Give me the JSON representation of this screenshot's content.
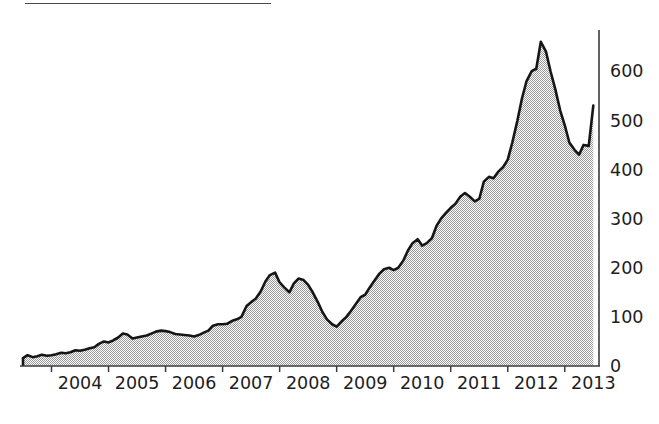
{
  "figure": {
    "top_rule": true,
    "background_color": "#ffffff"
  },
  "chart_data": {
    "type": "area",
    "title": "",
    "subtitle": "",
    "xlabel": "",
    "ylabel": "",
    "grid": false,
    "legend": "none",
    "fill_color": "#b3b3b3",
    "line_color": "#161616",
    "axis_color": "#3c3c3c",
    "xlim": [
      2003.5,
      2013.6
    ],
    "ylim": [
      0,
      690
    ],
    "y_ticks": [
      0,
      100,
      200,
      300,
      400,
      500,
      600
    ],
    "y_tick_labels": [
      "0",
      "100",
      "200",
      "300",
      "400",
      "500",
      "600"
    ],
    "x_ticks": [
      2004,
      2005,
      2006,
      2007,
      2008,
      2009,
      2010,
      2011,
      2012,
      2013
    ],
    "x_tick_labels": [
      "2004",
      "2005",
      "2006",
      "2007",
      "2008",
      "2009",
      "2010",
      "2011",
      "2012",
      "2013"
    ],
    "x": [
      2003.5,
      2003.58,
      2003.67,
      2003.75,
      2003.83,
      2003.92,
      2004.0,
      2004.08,
      2004.17,
      2004.25,
      2004.33,
      2004.42,
      2004.5,
      2004.58,
      2004.67,
      2004.75,
      2004.83,
      2004.92,
      2005.0,
      2005.08,
      2005.17,
      2005.25,
      2005.33,
      2005.42,
      2005.5,
      2005.58,
      2005.67,
      2005.75,
      2005.83,
      2005.92,
      2006.0,
      2006.08,
      2006.17,
      2006.25,
      2006.33,
      2006.42,
      2006.5,
      2006.58,
      2006.67,
      2006.75,
      2006.83,
      2006.92,
      2007.0,
      2007.08,
      2007.17,
      2007.25,
      2007.33,
      2007.42,
      2007.5,
      2007.58,
      2007.67,
      2007.75,
      2007.83,
      2007.92,
      2008.0,
      2008.08,
      2008.17,
      2008.25,
      2008.33,
      2008.42,
      2008.5,
      2008.58,
      2008.67,
      2008.75,
      2008.83,
      2008.92,
      2009.0,
      2009.08,
      2009.17,
      2009.25,
      2009.33,
      2009.42,
      2009.5,
      2009.58,
      2009.67,
      2009.75,
      2009.83,
      2009.92,
      2010.0,
      2010.08,
      2010.17,
      2010.25,
      2010.33,
      2010.42,
      2010.5,
      2010.58,
      2010.67,
      2010.75,
      2010.83,
      2010.92,
      2011.0,
      2011.08,
      2011.17,
      2011.25,
      2011.33,
      2011.42,
      2011.5,
      2011.58,
      2011.67,
      2011.75,
      2011.83,
      2011.92,
      2012.0,
      2012.08,
      2012.17,
      2012.25,
      2012.33,
      2012.42,
      2012.5,
      2012.58,
      2012.67,
      2012.75,
      2012.83,
      2012.92,
      2013.0,
      2013.08,
      2013.17,
      2013.25,
      2013.33,
      2013.42,
      2013.5
    ],
    "values": [
      16,
      22,
      18,
      20,
      23,
      21,
      22,
      24,
      27,
      26,
      28,
      32,
      31,
      33,
      36,
      38,
      45,
      50,
      48,
      52,
      58,
      66,
      64,
      56,
      58,
      60,
      62,
      66,
      70,
      72,
      71,
      69,
      65,
      64,
      63,
      62,
      60,
      63,
      68,
      72,
      82,
      85,
      85,
      86,
      92,
      95,
      100,
      122,
      130,
      137,
      152,
      172,
      185,
      190,
      170,
      160,
      150,
      168,
      178,
      175,
      165,
      150,
      130,
      110,
      95,
      85,
      80,
      90,
      100,
      112,
      125,
      140,
      145,
      160,
      175,
      188,
      197,
      200,
      195,
      200,
      215,
      235,
      250,
      258,
      245,
      250,
      260,
      285,
      300,
      312,
      322,
      330,
      345,
      352,
      345,
      335,
      340,
      375,
      385,
      382,
      395,
      405,
      420,
      455,
      500,
      545,
      580,
      600,
      605,
      660,
      640,
      600,
      565,
      520,
      490,
      455,
      440,
      430,
      450,
      448,
      530
    ],
    "series_notes": "Monthly closing level, mid-2003 through mid-2013"
  },
  "axis": {
    "y_axis_label_count": 7,
    "x_axis_label_count": 10,
    "peak_value": 660,
    "peak_year": "2012",
    "trough_value": 16,
    "end_value": 530
  }
}
